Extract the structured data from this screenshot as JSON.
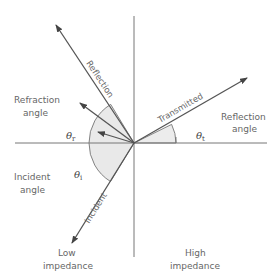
{
  "diagram": {
    "rays": {
      "reflection": "Reflection",
      "transmitted": "Transmitted",
      "incident": "Incident"
    },
    "labels": {
      "refraction_angle_line1": "Refraction",
      "refraction_angle_line2": "angle",
      "reflection_angle_line1": "Reflection",
      "reflection_angle_line2": "angle",
      "incident_angle_line1": "Incident",
      "incident_angle_line2": "angle",
      "low_impedance_line1": "Low",
      "low_impedance_line2": "impedance",
      "high_impedance_line1": "High",
      "high_impedance_line2": "impedance"
    },
    "angles": {
      "theta_symbol": "θ",
      "refraction_sub": "r",
      "incident_sub": "i",
      "transmitted_sub": "t"
    },
    "colors": {
      "line": "#555555",
      "shade": "#e8e8e8",
      "text": "#666666"
    }
  }
}
